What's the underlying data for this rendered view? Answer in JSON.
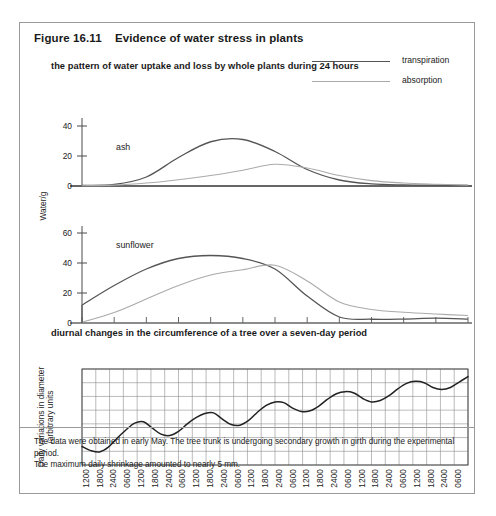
{
  "figure": {
    "number": "Figure 16.11",
    "title": "Evidence of water stress in plants",
    "subtitle_top": "the pattern of water uptake and loss by whole plants during 24 hours",
    "subtitle_bottom": "diurnal changes in the circumference of a tree over a seven-day period",
    "caption": "The data were obtained in early May.  The tree trunk is undergoing secondary growth in girth during the experimental period.\nThe maximum daily shrinkage amounted to nearly 5 mm.",
    "border_color": "#9a9a9a"
  },
  "legend": {
    "items": [
      {
        "label": "transpiration",
        "color": "#555555"
      },
      {
        "label": "absorption",
        "color": "#aaaaaa"
      }
    ]
  },
  "chart_data": [
    {
      "type": "line",
      "title": "the pattern of water uptake and loss by whole plants during 24 hours",
      "panel": "ash",
      "xlabel": "",
      "ylabel": "Water/g",
      "x": [
        "0600",
        "0800",
        "1000",
        "1200",
        "1400",
        "1600",
        "1800",
        "2000",
        "2200",
        "0000",
        "0200",
        "0400",
        "0600"
      ],
      "xticks": [
        "0600",
        "0800",
        "1000",
        "1200",
        "1400",
        "1600",
        "1800",
        "2000",
        "2200",
        "0000",
        "0200",
        "0400",
        "0600"
      ],
      "yticks": [
        0,
        20,
        40
      ],
      "ylim": [
        0,
        46
      ],
      "grid": false,
      "series": [
        {
          "name": "transpiration",
          "color": "#555555",
          "values": [
            0.4,
            1.0,
            6.0,
            19.0,
            29.5,
            31.0,
            23.0,
            11.0,
            4.0,
            1.4,
            0.7,
            0.5,
            0.4
          ]
        },
        {
          "name": "absorption",
          "color": "#aaaaaa",
          "values": [
            0.2,
            0.6,
            2.0,
            4.2,
            7.0,
            10.5,
            14.5,
            12.0,
            7.0,
            3.6,
            2.0,
            1.2,
            0.6
          ]
        }
      ]
    },
    {
      "type": "line",
      "panel": "sunflower",
      "xlabel": "",
      "ylabel": "Water/g",
      "x": [
        "0600",
        "0800",
        "1000",
        "1200",
        "1400",
        "1600",
        "1800",
        "2000",
        "2200",
        "0000",
        "0200",
        "0400",
        "0600"
      ],
      "xticks": [
        "0600",
        "0800",
        "1000",
        "1200",
        "1400",
        "1600",
        "1800",
        "2000",
        "2200",
        "0000",
        "0200",
        "0400",
        "0600"
      ],
      "yticks": [
        0,
        20,
        40,
        60
      ],
      "ylim": [
        0,
        66
      ],
      "grid": false,
      "series": [
        {
          "name": "transpiration",
          "color": "#555555",
          "values": [
            12.0,
            25.0,
            36.0,
            43.0,
            45.0,
            43.0,
            36.0,
            18.0,
            4.0,
            2.5,
            2.6,
            3.2,
            2.6
          ]
        },
        {
          "name": "absorption",
          "color": "#aaaaaa",
          "values": [
            0.5,
            7.0,
            16.0,
            25.0,
            32.0,
            35.5,
            38.5,
            28.0,
            14.0,
            9.0,
            7.2,
            6.0,
            5.0
          ]
        }
      ]
    },
    {
      "type": "line",
      "title": "diurnal changes in the circumference of a tree over a seven-day period",
      "panel": "tree-circumference",
      "xlabel": "",
      "ylabel": "Daily variations in diameter\n/arbitrary units",
      "xticks": [
        "1200",
        "1800",
        "2400",
        "0600",
        "1200",
        "1800",
        "2400",
        "0600",
        "1200",
        "1800",
        "2400",
        "0600",
        "1200",
        "1800",
        "2400",
        "0600",
        "1200",
        "1800",
        "2400",
        "0600",
        "1200",
        "1800",
        "2400",
        "0600",
        "1200",
        "1800",
        "2400",
        "0600"
      ],
      "yticks": [
        0,
        1,
        2,
        3,
        4,
        5,
        6,
        7
      ],
      "ylim": [
        0,
        7
      ],
      "grid": true,
      "series": [
        {
          "name": "trunk diameter",
          "color": "#222222",
          "values": [
            1.35,
            1.05,
            0.95,
            1.3,
            1.95,
            2.55,
            3.05,
            3.15,
            2.7,
            2.25,
            2.15,
            2.45,
            3.0,
            3.45,
            3.75,
            3.8,
            3.35,
            2.95,
            2.9,
            3.25,
            3.85,
            4.35,
            4.6,
            4.55,
            4.15,
            3.9,
            3.95,
            4.3,
            4.8,
            5.2,
            5.35,
            5.25,
            4.85,
            4.6,
            4.7,
            5.05,
            5.55,
            5.95,
            6.1,
            6.0,
            5.65,
            5.5,
            5.65,
            6.05,
            6.45
          ]
        }
      ]
    }
  ]
}
